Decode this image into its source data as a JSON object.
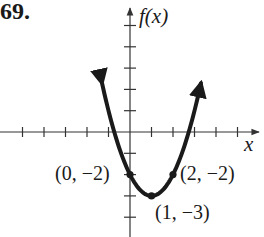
{
  "problem_number": "69.",
  "chart_data": {
    "type": "line",
    "title": "",
    "function": "f(x) = (x - 1)^2 - 3",
    "xlabel": "x",
    "ylabel": "f(x)",
    "xlim": [
      -6,
      6
    ],
    "ylim": [
      -5,
      6
    ],
    "grid": false,
    "x_ticks": [
      -5,
      -4,
      -3,
      -2,
      -1,
      1,
      2,
      3,
      4,
      5
    ],
    "y_ticks": [
      -4,
      -3,
      -2,
      -1,
      1,
      2,
      3,
      4,
      5
    ],
    "series": [
      {
        "name": "parabola",
        "x": [
          -1.3,
          -1,
          0,
          1,
          2,
          3,
          3.3
        ],
        "values": [
          2.29,
          1,
          -2,
          -3,
          -2,
          1,
          2.29
        ]
      }
    ],
    "points": [
      {
        "x": 0,
        "y": -2,
        "label": "(0, −2)"
      },
      {
        "x": 1,
        "y": -3,
        "label": "(1, −3)"
      },
      {
        "x": 2,
        "y": -2,
        "label": "(2, −2)"
      }
    ],
    "colors": {
      "curve": "#1a1a1a",
      "axes": "#333333"
    }
  },
  "labels": {
    "x_axis": "x",
    "y_axis": "f(x)",
    "point_0": "(0, −2)",
    "point_1": "(1, −3)",
    "point_2": "(2, −2)"
  }
}
